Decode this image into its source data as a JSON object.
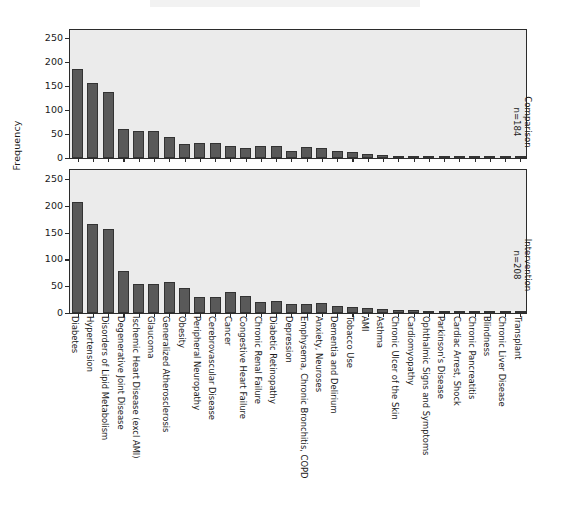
{
  "chart_data": {
    "type": "bar",
    "title": "",
    "xlabel": "",
    "ylabel": "Frequency",
    "ylim": [
      0,
      265
    ],
    "yticks": [
      0,
      50,
      100,
      150,
      200,
      250
    ],
    "grid": false,
    "legend_position": "right-strip",
    "categories": [
      "Diabetes",
      "Hypertension",
      "Disorders of Lipid Metabolism",
      "Degenerative Joint Disease",
      "Ischemic Heart Disease (excl AMI)",
      "Glaucoma",
      "Generalized Atherosclerosis",
      "Obesity",
      "Peripheral Neuropathy",
      "Cerebrovascular Disease",
      "Cancer",
      "Congestive Heart Failure",
      "Chronic Renal Failure",
      "Diabetic Retinopathy",
      "Depression",
      "Emphysema, Chronic Bronchitis, COPD",
      "Anxiety, Neuroses",
      "Dementia and Delirium",
      "Tobacco Use",
      "AMI",
      "Asthma",
      "Chronic Ulcer of the Skin",
      "Cardiomyopathy",
      "Ophthalmic Signs and Symptoms",
      "Parkinson's Disease",
      "Cardiac Arrest, Shock",
      "Chronic Pancreatitis",
      "Blindness",
      "Chronic Liver Disease",
      "Transplant"
    ],
    "series": [
      {
        "name": "Comparison",
        "n_label": "n=184",
        "panel_title": "Comparison\nn=184",
        "values": [
          186,
          157,
          138,
          61,
          57,
          57,
          44,
          29,
          32,
          31,
          26,
          20,
          26,
          25,
          15,
          22,
          20,
          15,
          12,
          9,
          7,
          5,
          4,
          4,
          3,
          3,
          2,
          2,
          2,
          1
        ]
      },
      {
        "name": "Intervention",
        "n_label": "n=208",
        "panel_title": "Intervention\nn=208",
        "values": [
          208,
          167,
          156,
          79,
          55,
          55,
          58,
          46,
          29,
          29,
          40,
          32,
          21,
          22,
          16,
          16,
          18,
          14,
          12,
          10,
          8,
          6,
          5,
          4,
          3,
          3,
          2,
          2,
          1,
          1
        ]
      }
    ],
    "colors": {
      "bar_fill": "#595959",
      "bar_edge": "#333333",
      "panel_background": "#ebebeb",
      "panel_border": "#2b2b2b",
      "text": "#1a1a1a",
      "figure_background": "#ffffff"
    }
  }
}
